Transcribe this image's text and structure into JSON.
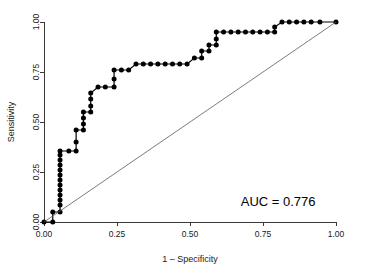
{
  "chart_data": {
    "type": "line",
    "title": "",
    "xlabel": "1 – Specificity",
    "ylabel": "Sensitivity",
    "xlim": [
      0.0,
      1.0
    ],
    "ylim": [
      0.0,
      1.0
    ],
    "grid": false,
    "legend": null,
    "annotations": [
      {
        "name": "auc-label",
        "text": "AUC = 0.776",
        "x": 0.93,
        "y": 0.08
      }
    ],
    "xticks": [
      0.0,
      0.25,
      0.5,
      0.75,
      1.0
    ],
    "xticklabels": [
      "0.00",
      "0.25",
      "0.50",
      "0.75",
      "1.00"
    ],
    "yticks": [
      0.0,
      0.25,
      0.5,
      0.75,
      1.0
    ],
    "yticklabels": [
      "0.00",
      "0.25",
      "0.50",
      "0.75",
      "1.00"
    ],
    "series": [
      {
        "name": "ROC curve",
        "marker": "filled-circle",
        "color": "#000000",
        "x": [
          0.0,
          0.03,
          0.03,
          0.055,
          0.055,
          0.055,
          0.055,
          0.055,
          0.055,
          0.055,
          0.055,
          0.055,
          0.055,
          0.055,
          0.055,
          0.055,
          0.085,
          0.11,
          0.11,
          0.11,
          0.135,
          0.135,
          0.135,
          0.135,
          0.16,
          0.16,
          0.16,
          0.16,
          0.185,
          0.21,
          0.24,
          0.24,
          0.24,
          0.265,
          0.29,
          0.315,
          0.34,
          0.365,
          0.39,
          0.415,
          0.44,
          0.465,
          0.49,
          0.515,
          0.54,
          0.54,
          0.565,
          0.565,
          0.59,
          0.59,
          0.59,
          0.615,
          0.64,
          0.665,
          0.69,
          0.715,
          0.74,
          0.765,
          0.79,
          0.79,
          0.815,
          0.84,
          0.865,
          0.89,
          0.915,
          0.945,
          1.0
        ],
        "y": [
          0.0,
          0.0,
          0.05,
          0.05,
          0.085,
          0.11,
          0.135,
          0.16,
          0.185,
          0.21,
          0.235,
          0.26,
          0.285,
          0.31,
          0.335,
          0.355,
          0.355,
          0.355,
          0.4,
          0.46,
          0.46,
          0.49,
          0.52,
          0.55,
          0.55,
          0.58,
          0.615,
          0.645,
          0.675,
          0.675,
          0.675,
          0.715,
          0.76,
          0.76,
          0.76,
          0.79,
          0.79,
          0.79,
          0.79,
          0.79,
          0.79,
          0.79,
          0.79,
          0.82,
          0.82,
          0.855,
          0.855,
          0.885,
          0.885,
          0.915,
          0.95,
          0.95,
          0.95,
          0.95,
          0.95,
          0.95,
          0.95,
          0.95,
          0.95,
          0.975,
          1.0,
          1.0,
          1.0,
          1.0,
          1.0,
          1.0,
          1.0
        ]
      },
      {
        "name": "reference-diagonal",
        "marker": "none",
        "color": "#5a5a5a",
        "x": [
          0.0,
          1.0
        ],
        "y": [
          0.0,
          1.0
        ]
      }
    ]
  }
}
